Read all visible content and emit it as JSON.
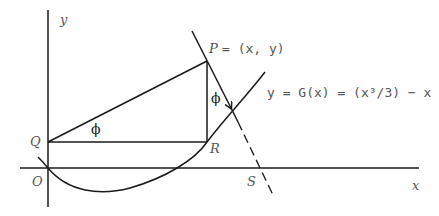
{
  "diagram": {
    "axes": {
      "x_label": "x",
      "y_label": "y",
      "origin_label": "O"
    },
    "points": {
      "P": "P",
      "P_coords": "= (x, y)",
      "Q": "Q",
      "R": "R",
      "S": "S"
    },
    "angles": {
      "phi_at_Q": "ϕ",
      "phi_at_P": "ϕ"
    },
    "curve_label": "y = G(x) = (x³/3) − x",
    "colors": {
      "line": "#1a1a1a",
      "label": "#555555"
    }
  }
}
